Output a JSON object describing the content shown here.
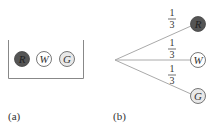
{
  "panel_a": {
    "label": "(a)",
    "balls": [
      {
        "letter": "R",
        "fill": "#555555",
        "text_color": "#222222"
      },
      {
        "letter": "W",
        "fill": "#ffffff",
        "text_color": "#333333"
      },
      {
        "letter": "G",
        "fill": "#e8e8e8",
        "text_color": "#333333"
      }
    ]
  },
  "panel_b": {
    "label": "(b)",
    "branches": [
      {
        "prob_num": "1",
        "prob_den": "3",
        "letter": "R",
        "fill": "#555555"
      },
      {
        "prob_num": "1",
        "prob_den": "3",
        "letter": "W",
        "fill": "#ffffff"
      },
      {
        "prob_num": "1",
        "prob_den": "3",
        "letter": "G",
        "fill": "#e8e8e8"
      }
    ]
  },
  "colors": {
    "line": "#aaaaaa",
    "stroke": "#555555"
  }
}
